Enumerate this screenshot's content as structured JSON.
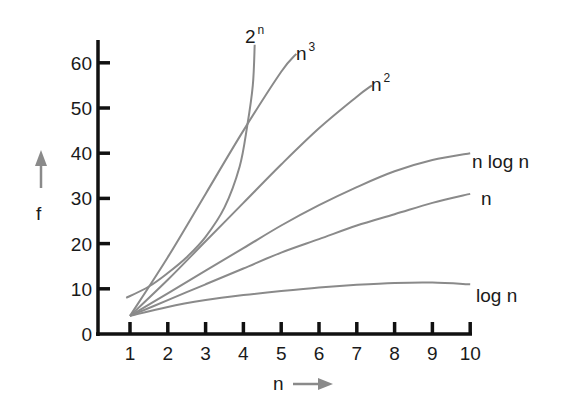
{
  "chart_data": {
    "type": "line",
    "title": "",
    "xlabel": "n",
    "ylabel": "f",
    "xlim": [
      0,
      10
    ],
    "ylim": [
      0,
      65
    ],
    "grid": false,
    "legend_position": "inline labels at curve ends",
    "x_ticks": [
      1,
      2,
      3,
      4,
      5,
      6,
      7,
      8,
      9,
      10
    ],
    "y_ticks": [
      0,
      10,
      20,
      30,
      40,
      50,
      60
    ],
    "x_tick_labels": [
      "1",
      "2",
      "3",
      "4",
      "5",
      "6",
      "7",
      "8",
      "9",
      "10"
    ],
    "y_tick_labels": [
      "0",
      "10",
      "20",
      "30",
      "40",
      "50",
      "60"
    ],
    "series": [
      {
        "name": "log n",
        "label_base": "log n",
        "label_sup": "",
        "x": [
          1,
          2,
          3,
          4,
          5,
          6,
          7,
          8,
          9,
          10
        ],
        "y": [
          4,
          6,
          7.5,
          8.6,
          9.5,
          10.3,
          10.9,
          11.3,
          11.4,
          11
        ]
      },
      {
        "name": "n",
        "label_base": "n",
        "label_sup": "",
        "x": [
          1,
          2,
          3,
          4,
          5,
          6,
          7,
          8,
          9,
          10
        ],
        "y": [
          4,
          7.5,
          11,
          14.5,
          18,
          21,
          24,
          26.5,
          29,
          31
        ]
      },
      {
        "name": "n log n",
        "label_base": "n log n",
        "label_sup": "",
        "x": [
          1,
          2,
          3,
          4,
          5,
          6,
          7,
          8,
          9,
          10
        ],
        "y": [
          4,
          9,
          14,
          19,
          24,
          28.5,
          32.5,
          36,
          38.5,
          40
        ]
      },
      {
        "name": "n^2",
        "label_base": "n",
        "label_sup": "2",
        "x": [
          1,
          2,
          3,
          4,
          5,
          6,
          7,
          7.4
        ],
        "y": [
          4,
          12,
          20.5,
          29,
          37.5,
          45.5,
          52.5,
          55
        ]
      },
      {
        "name": "n^3",
        "label_base": "n",
        "label_sup": "3",
        "x": [
          1,
          2,
          3,
          4,
          5,
          5.4
        ],
        "y": [
          4,
          17,
          31,
          45,
          58,
          62
        ]
      },
      {
        "name": "2^n",
        "label_base": "2",
        "label_sup": "n",
        "x": [
          0.9,
          1.5,
          2,
          2.5,
          3,
          3.5,
          3.9,
          4.1,
          4.25,
          4.3
        ],
        "y": [
          8,
          10.5,
          13.5,
          17,
          21.5,
          28,
          37,
          46,
          55,
          64
        ]
      }
    ],
    "annotations": [
      "f ↑ (vertical arrow next to y-axis)",
      "n → (horizontal arrow under x-axis)"
    ]
  },
  "axes": {
    "x_title": "n",
    "y_title": "f"
  },
  "style": {
    "curve_color": "#8a8a8a",
    "axis_color": "#111111",
    "arrow_color": "#8a8a8a"
  }
}
